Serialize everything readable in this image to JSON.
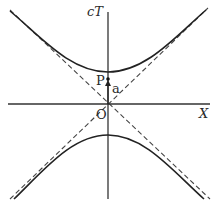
{
  "diagram": {
    "type": "spacetime-hyperbola",
    "axes": {
      "vertical_label": "cT",
      "horizontal_label": "X",
      "origin_label": "O"
    },
    "points": {
      "event_label": "P",
      "vector_label": "a"
    },
    "elements": {
      "hyperbola_branches": [
        "upper",
        "lower"
      ],
      "asymptotes": [
        "light-line +45°",
        "light-line -45°"
      ],
      "asymptote_style": "dashed"
    },
    "colors": {
      "ink": "#2a2a2a",
      "background": "#ffffff"
    }
  }
}
